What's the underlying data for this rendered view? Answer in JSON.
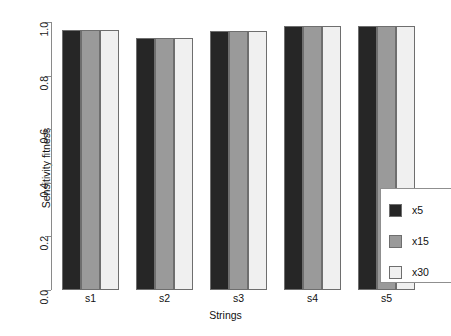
{
  "chart_data": {
    "type": "bar",
    "title": "",
    "xlabel": "Strings",
    "ylabel": "Sensitivity fitness",
    "categories": [
      "s1",
      "s2",
      "s3",
      "s4",
      "s5"
    ],
    "series": [
      {
        "name": "x5",
        "color": "#262626",
        "values": [
          0.97,
          0.94,
          0.965,
          0.985,
          0.985
        ]
      },
      {
        "name": "x15",
        "color": "#9a9a9a",
        "values": [
          0.97,
          0.94,
          0.965,
          0.985,
          0.985
        ]
      },
      {
        "name": "x30",
        "color": "#f0f0f0",
        "values": [
          0.97,
          0.94,
          0.965,
          0.985,
          0.985
        ]
      }
    ],
    "ylim": [
      0.0,
      1.0
    ],
    "yticks": [
      "0.0",
      "0.2",
      "0.4",
      "0.6",
      "0.8",
      "1.0"
    ],
    "ytick_values": [
      0.0,
      0.2,
      0.4,
      0.6,
      0.8,
      1.0
    ],
    "grid": false,
    "legend_position": "bottom-right"
  },
  "legend": {
    "entries": [
      {
        "label": "x5",
        "color": "#262626"
      },
      {
        "label": "x15",
        "color": "#9a9a9a"
      },
      {
        "label": "x30",
        "color": "#f0f0f0"
      }
    ]
  },
  "axes": {
    "y_title": "Sensitivity fitness",
    "x_title": "Strings"
  }
}
